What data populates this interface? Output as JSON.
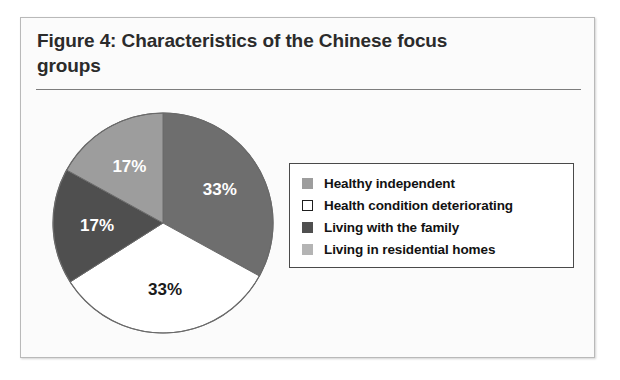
{
  "figure": {
    "title": "Figure 4: Characteristics of the Chinese focus groups",
    "frame_border_color": "#b9b9b9",
    "background_color": "#fbfbfb",
    "rule_color": "#7d7d7d"
  },
  "legend": {
    "position": "right",
    "border_color": "#4a4a4a",
    "items": [
      {
        "label": "Healthy independent",
        "color": "#9d9d9d",
        "swatch": "filled"
      },
      {
        "label": "Health condition deteriorating",
        "color": "#ffffff",
        "swatch": "outlined"
      },
      {
        "label": "Living with the family",
        "color": "#4f4f4f",
        "swatch": "filled"
      },
      {
        "label": "Living in residential homes",
        "color": "#b4b4b4",
        "swatch": "filled"
      }
    ]
  },
  "chart_data": {
    "type": "pie",
    "title": "Figure 4: Characteristics of the Chinese focus groups",
    "xlabel": "",
    "ylabel": "",
    "start_angle_deg": 0,
    "direction": "clockwise",
    "categories": [
      "Healthy independent",
      "Health condition deteriorating",
      "Living with the family",
      "Living in residential homes"
    ],
    "values": [
      33,
      33,
      17,
      17
    ],
    "value_unit": "%",
    "data_labels": [
      "33%",
      "33%",
      "17%",
      "17%"
    ],
    "slice_colors": [
      "#6e6e6e",
      "#ffffff",
      "#4f4f4f",
      "#9d9d9d"
    ],
    "label_colors": [
      "#ffffff",
      "#1a1a1a",
      "#ffffff",
      "#ffffff"
    ],
    "legend_entries": [
      "Healthy independent",
      "Health condition deteriorating",
      "Living with the family",
      "Living in residential homes"
    ],
    "grid": false,
    "outline_color": "#6a6a6a"
  }
}
